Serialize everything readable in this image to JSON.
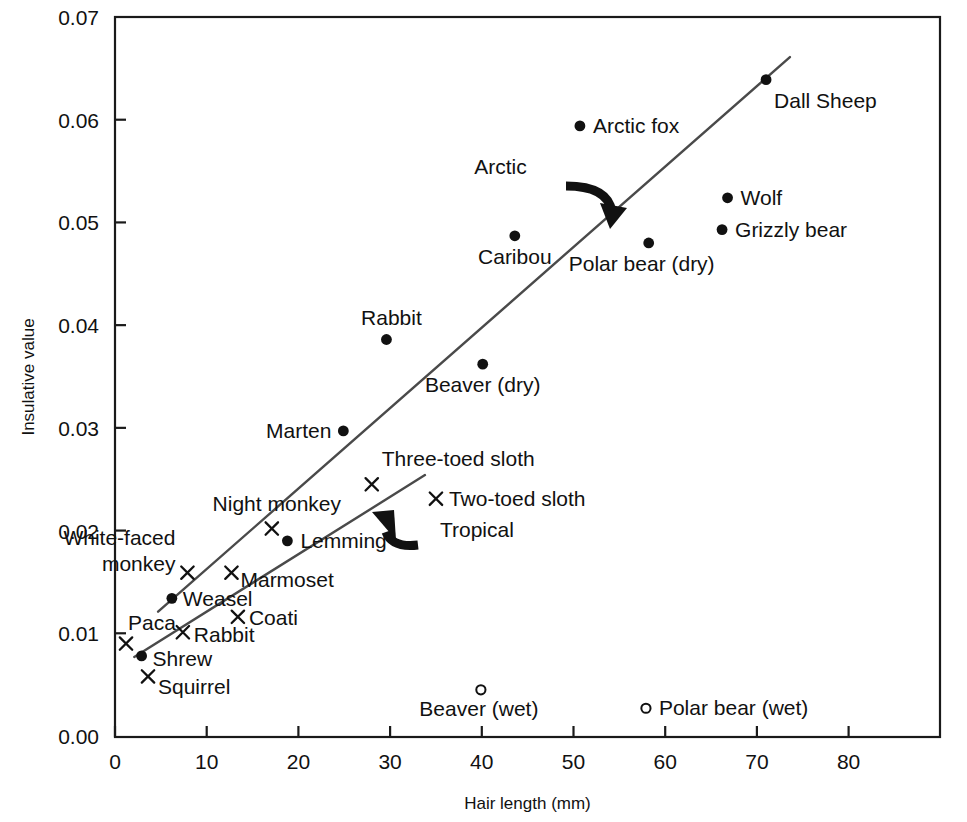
{
  "chart_data": {
    "type": "scatter",
    "title": "",
    "xlabel": "Hair length (mm)",
    "ylabel": "Insulative value",
    "xlim": [
      -2,
      89
    ],
    "ylim": [
      0.0,
      0.07
    ],
    "xticks": [
      0,
      10,
      20,
      30,
      40,
      50,
      60,
      70,
      80
    ],
    "xtick_labels": [
      "0",
      "10",
      "20",
      "30",
      "40",
      "50",
      "60",
      "70",
      "80"
    ],
    "yticks": [
      0.0,
      0.01,
      0.02,
      0.03,
      0.04,
      0.05,
      0.06,
      0.07
    ],
    "ytick_labels": [
      "0.00",
      "0.01",
      "0.02",
      "0.03",
      "0.04",
      "0.05",
      "0.06",
      "0.07"
    ],
    "grid": false,
    "legend": "none",
    "marker_kinds": {
      "filled-circle": "Arctic / temperate mammal (dry)",
      "cross": "Tropical mammal",
      "open-circle": "Wet fur"
    },
    "points": [
      {
        "label": "Dall Sheep",
        "x": 71.0,
        "y": 0.0639,
        "marker": "filled-circle",
        "label_dx": 8,
        "label_dy": 28,
        "anchor": "start"
      },
      {
        "label": "Arctic fox",
        "x": 50.7,
        "y": 0.0594,
        "marker": "filled-circle",
        "label_dx": 13,
        "label_dy": 7,
        "anchor": "start"
      },
      {
        "label": "Wolf",
        "x": 66.8,
        "y": 0.0524,
        "marker": "filled-circle",
        "label_dx": 13,
        "label_dy": 7,
        "anchor": "start"
      },
      {
        "label": "Grizzly bear",
        "x": 66.2,
        "y": 0.0493,
        "marker": "filled-circle",
        "label_dx": 13,
        "label_dy": 7,
        "anchor": "start"
      },
      {
        "label": "Polar bear (dry)",
        "x": 58.2,
        "y": 0.048,
        "marker": "filled-circle",
        "label_dx": -7,
        "label_dy": 28,
        "anchor": "middle"
      },
      {
        "label": "Caribou",
        "x": 43.6,
        "y": 0.0487,
        "marker": "filled-circle",
        "label_dx": 0,
        "label_dy": 28,
        "anchor": "middle"
      },
      {
        "label": "Rabbit",
        "x": 29.6,
        "y": 0.0386,
        "marker": "filled-circle",
        "label_dx": 5,
        "label_dy": -15,
        "anchor": "middle"
      },
      {
        "label": "Beaver (dry)",
        "x": 40.1,
        "y": 0.0362,
        "marker": "filled-circle",
        "label_dx": 0,
        "label_dy": 28,
        "anchor": "middle"
      },
      {
        "label": "Marten",
        "x": 24.9,
        "y": 0.0297,
        "marker": "filled-circle",
        "label_dx": -12,
        "label_dy": 7,
        "anchor": "end"
      },
      {
        "label": "Three-toed sloth",
        "x": 28.0,
        "y": 0.0245,
        "marker": "cross",
        "label_dx": 10,
        "label_dy": -18,
        "anchor": "start"
      },
      {
        "label": "Two-toed sloth",
        "x": 35.0,
        "y": 0.0231,
        "marker": "cross",
        "label_dx": 13,
        "label_dy": 7,
        "anchor": "start"
      },
      {
        "label": "Night monkey",
        "x": 17.1,
        "y": 0.0202,
        "marker": "cross",
        "label_dx": 5,
        "label_dy": -18,
        "anchor": "middle"
      },
      {
        "label": "Lemming",
        "x": 18.8,
        "y": 0.019,
        "marker": "filled-circle",
        "label_dx": 13,
        "label_dy": 7,
        "anchor": "start"
      },
      {
        "label": "White-faced monkey",
        "x": 7.9,
        "y": 0.0159,
        "marker": "cross",
        "label_dx": -12,
        "label_dy": -28,
        "anchor": "end",
        "multiline": [
          "White-faced",
          "monkey"
        ]
      },
      {
        "label": "Marmoset",
        "x": 12.7,
        "y": 0.0159,
        "marker": "cross",
        "label_dx": 9,
        "label_dy": 14,
        "anchor": "start"
      },
      {
        "label": "Weasel",
        "x": 6.2,
        "y": 0.0134,
        "marker": "filled-circle",
        "label_dx": 11,
        "label_dy": 8,
        "anchor": "start"
      },
      {
        "label": "Coati",
        "x": 13.4,
        "y": 0.0116,
        "marker": "cross",
        "label_dx": 11,
        "label_dy": 8,
        "anchor": "start"
      },
      {
        "label": "Rabbit",
        "x": 7.4,
        "y": 0.0101,
        "marker": "cross",
        "label_dx": 11,
        "label_dy": 10,
        "anchor": "start"
      },
      {
        "label": "Paca",
        "x": 1.2,
        "y": 0.009,
        "marker": "cross",
        "label_dx": 2,
        "label_dy": -14,
        "anchor": "start"
      },
      {
        "label": "Shrew",
        "x": 2.9,
        "y": 0.0078,
        "marker": "filled-circle",
        "label_dx": 11,
        "label_dy": 10,
        "anchor": "start"
      },
      {
        "label": "Squirrel",
        "x": 3.6,
        "y": 0.0058,
        "marker": "cross",
        "label_dx": 10,
        "label_dy": 18,
        "anchor": "start"
      },
      {
        "label": "Beaver (wet)",
        "x": 39.9,
        "y": 0.0045,
        "marker": "open-circle",
        "label_dx": -2,
        "label_dy": 26,
        "anchor": "middle"
      },
      {
        "label": "Polar bear (wet)",
        "x": 57.9,
        "y": 0.0027,
        "marker": "open-circle",
        "label_dx": 13,
        "label_dy": 7,
        "anchor": "start"
      }
    ],
    "trend_lines": [
      {
        "name": "Arctic",
        "x0": 4.7,
        "y0": 0.0121,
        "x1": 73.6,
        "y1": 0.0661
      },
      {
        "name": "Tropical",
        "x0": 2.1,
        "y0": 0.0077,
        "x1": 33.8,
        "y1": 0.0254
      }
    ],
    "annotations": [
      {
        "label": "Arctic",
        "x": 42.5,
        "y": 0.0554
      },
      {
        "label": "Tropical",
        "x": 35.0,
        "y": 0.0202
      }
    ]
  },
  "colors": {
    "axis": "#1a1a1a",
    "marker": "#111111",
    "line": "#4a4a4a",
    "background": "#ffffff"
  }
}
